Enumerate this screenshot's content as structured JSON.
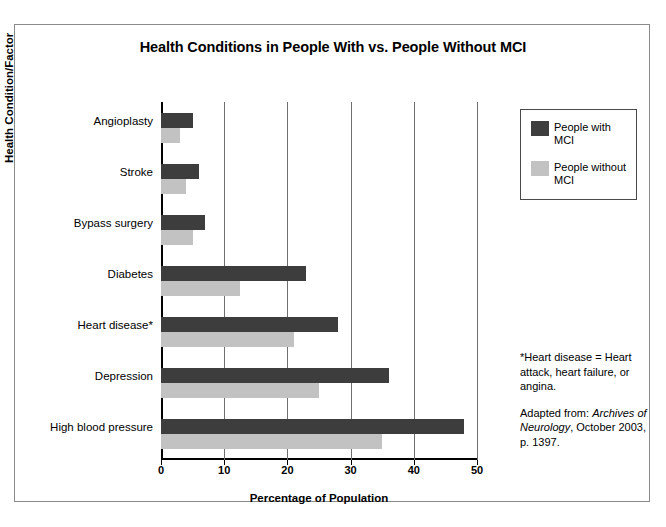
{
  "chart_data": {
    "type": "bar",
    "orientation": "horizontal",
    "title": "Health Conditions in People With vs. People Without MCI",
    "xlabel": "Percentage of Population",
    "ylabel": "Health Condition/Factor",
    "xlim": [
      0,
      50
    ],
    "xticks": [
      "0",
      "10",
      "20",
      "30",
      "40",
      "50"
    ],
    "grid": "vertical",
    "legend_position": "top-right",
    "categories": [
      "Angioplasty",
      "Stroke",
      "Bypass surgery",
      "Diabetes",
      "Heart disease*",
      "Depression",
      "High blood pressure"
    ],
    "series": [
      {
        "name": "People with MCI",
        "color": "#3d3d3d",
        "values": [
          5,
          6,
          7,
          23,
          28,
          36,
          48
        ]
      },
      {
        "name": "People without MCI",
        "color": "#c2c2c2",
        "values": [
          3,
          4,
          5,
          12.5,
          21,
          25,
          35
        ]
      }
    ]
  },
  "legend": {
    "items": [
      {
        "label": "People with MCI",
        "swatch": "with"
      },
      {
        "label": "People without MCI",
        "swatch": "without"
      }
    ]
  },
  "notes": {
    "footnote_line1": "*Heart disease = Heart attack, heart failure, or angina.",
    "source_prefix": "Adapted from: ",
    "source_italic": "Archives of Neurology",
    "source_suffix": ", October 2003, p. 1397."
  }
}
